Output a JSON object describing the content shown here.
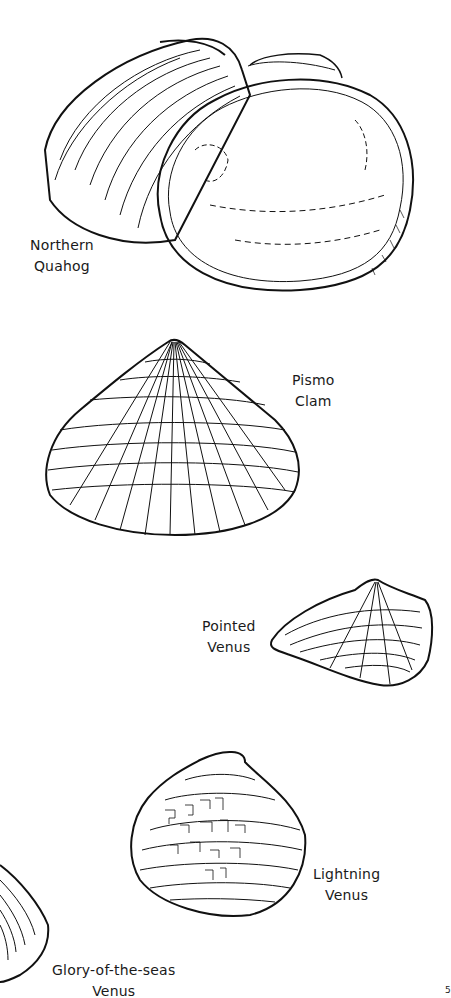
{
  "page": {
    "background": "#ffffff",
    "ink": "#111111"
  },
  "shells": [
    {
      "name": "Northern Quahog",
      "lines": [
        "Northern",
        "Quahog"
      ]
    },
    {
      "name": "Pismo Clam",
      "lines": [
        "Pismo",
        "Clam"
      ]
    },
    {
      "name": "Pointed Venus",
      "lines": [
        "Pointed",
        "Venus"
      ]
    },
    {
      "name": "Lightning Venus",
      "lines": [
        "Lightning",
        "Venus"
      ]
    },
    {
      "name": "Glory-of-the-seas Venus",
      "lines": [
        "Glory-of-the-seas",
        "Venus"
      ]
    }
  ],
  "corner_fragment": "5"
}
